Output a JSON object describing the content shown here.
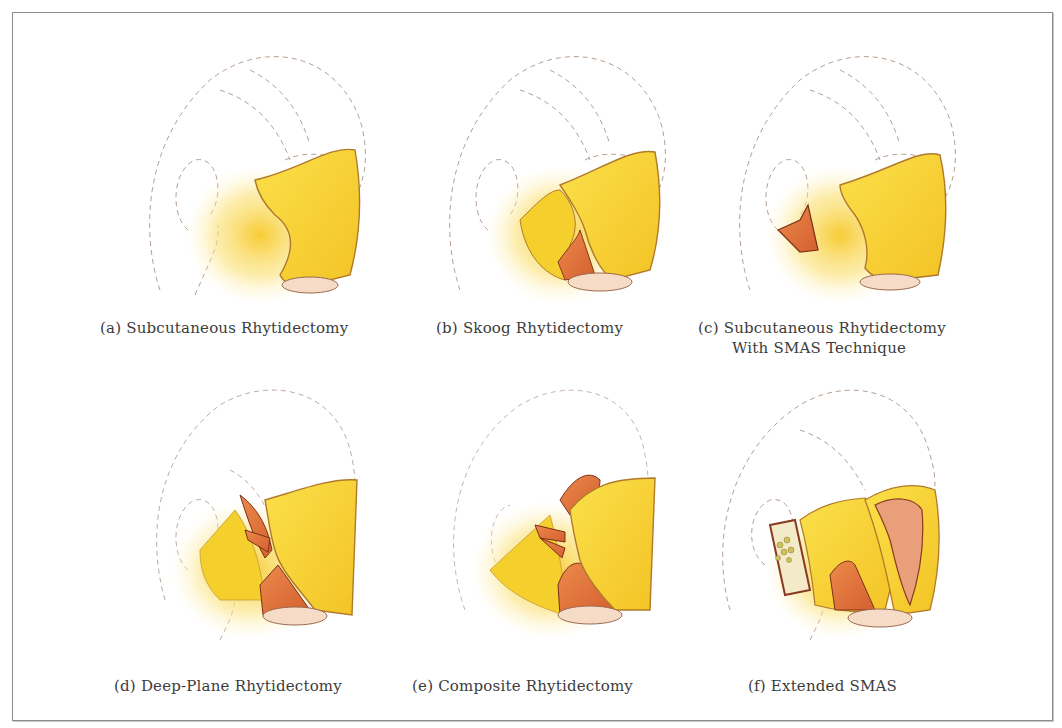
{
  "figure": {
    "panels": [
      {
        "id": "a",
        "label": "(a)",
        "title": "Subcutaneous Rhytidectomy",
        "title_line2": ""
      },
      {
        "id": "b",
        "label": "(b)",
        "title": "Skoog Rhytidectomy",
        "title_line2": ""
      },
      {
        "id": "c",
        "label": "(c)",
        "title": "Subcutaneous Rhytidectomy",
        "title_line2": "With SMAS Technique"
      },
      {
        "id": "d",
        "label": "(d)",
        "title": "Deep-Plane Rhytidectomy",
        "title_line2": ""
      },
      {
        "id": "e",
        "label": "(e)",
        "title": "Composite Rhytidectomy",
        "title_line2": ""
      },
      {
        "id": "f",
        "label": "(f)",
        "title": "Extended SMAS",
        "title_line2": ""
      }
    ],
    "colors": {
      "skin_flap": "#f7d233",
      "flap_shadow": "#e9b21a",
      "muscle": "#e0713a",
      "muscle_dark": "#b9482a",
      "outline": "#9a7a6a",
      "fat": "#f2eac8",
      "frame_border": "#8c8c8c",
      "caption_text": "#3c3c3c"
    }
  }
}
